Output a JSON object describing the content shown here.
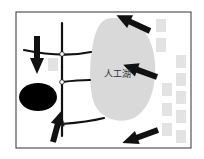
{
  "diagram": {
    "title": "",
    "frame": {
      "x": 16,
      "y": 12,
      "w": 175,
      "h": 136,
      "stroke": "#333333"
    },
    "lake": {
      "label": "人工湖",
      "fill": "#d9d9d9",
      "label_pos": {
        "x": 106,
        "y": 65
      }
    },
    "colors": {
      "road": "#111111",
      "arrow": "#111111",
      "building": "#e3e3e3",
      "pond": "#000000",
      "node": "#ffffff"
    },
    "nodes": [
      {
        "x": 62,
        "y": 54
      },
      {
        "x": 62,
        "y": 82
      },
      {
        "x": 62,
        "y": 124
      }
    ],
    "buildings": [
      {
        "x": 48,
        "y": 58,
        "w": 10,
        "h": 13
      },
      {
        "x": 156,
        "y": 19,
        "w": 10,
        "h": 13
      },
      {
        "x": 156,
        "y": 38,
        "w": 10,
        "h": 14
      },
      {
        "x": 176,
        "y": 55,
        "w": 10,
        "h": 13
      },
      {
        "x": 176,
        "y": 73,
        "w": 10,
        "h": 13
      },
      {
        "x": 162,
        "y": 83,
        "w": 10,
        "h": 13
      },
      {
        "x": 176,
        "y": 91,
        "w": 10,
        "h": 13
      },
      {
        "x": 162,
        "y": 103,
        "w": 10,
        "h": 13
      },
      {
        "x": 176,
        "y": 110,
        "w": 10,
        "h": 13
      },
      {
        "x": 162,
        "y": 123,
        "w": 10,
        "h": 13
      },
      {
        "x": 176,
        "y": 130,
        "w": 10,
        "h": 13
      }
    ],
    "arrows": [
      {
        "name": "arrow-top-left-down",
        "from": [
          37,
          36
        ],
        "to": [
          37,
          74
        ]
      },
      {
        "name": "arrow-bottom-left-up",
        "from": [
          53,
          142
        ],
        "to": [
          45,
          111
        ]
      },
      {
        "name": "arrow-top-right",
        "from": [
          150,
          31
        ],
        "to": [
          116,
          47
        ]
      },
      {
        "name": "arrow-middle-right",
        "from": [
          157,
          77
        ],
        "to": [
          123,
          89
        ]
      },
      {
        "name": "arrow-bottom-right",
        "from": [
          158,
          130
        ],
        "to": [
          122,
          117
        ]
      }
    ]
  }
}
